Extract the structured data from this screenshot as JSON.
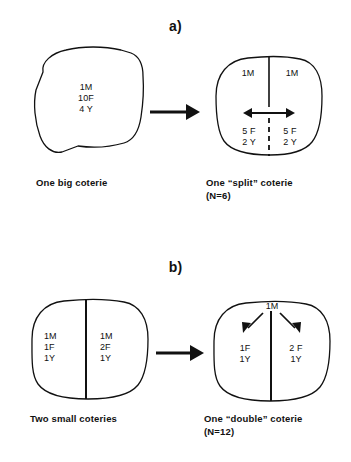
{
  "figure": {
    "background_color": "#ffffff",
    "ink_color": "#111111"
  },
  "panels": [
    {
      "label": "a)",
      "before": {
        "shape": "blob",
        "caption": "One big coterie",
        "compartments": [
          {
            "lines": [
              "1M",
              "10F",
              "4 Y"
            ]
          }
        ]
      },
      "transition_arrow": "right-arrow",
      "after": {
        "shape": "rounded-blob",
        "caption_line1": "One “split” coterie",
        "caption_line2": "(N=6)",
        "divider_top": "solid",
        "divider_bottom": "dashed",
        "inner_arrow": "double-headed-horizontal-arrow",
        "compartments": [
          {
            "position": "top-left",
            "lines": [
              "1M"
            ]
          },
          {
            "position": "top-right",
            "lines": [
              "1M"
            ]
          },
          {
            "position": "bottom-left",
            "lines": [
              "5 F",
              "2 Y"
            ]
          },
          {
            "position": "bottom-right",
            "lines": [
              "5 F",
              "2 Y"
            ]
          }
        ]
      }
    },
    {
      "label": "b)",
      "before": {
        "shape": "rounded-blob",
        "caption": "Two small coteries",
        "divider": "solid",
        "compartments": [
          {
            "position": "left",
            "lines": [
              "1M",
              "1F",
              "1Y"
            ]
          },
          {
            "position": "right",
            "lines": [
              "1M",
              "2F",
              "1Y"
            ]
          }
        ]
      },
      "transition_arrow": "right-arrow",
      "after": {
        "shape": "rounded-blob",
        "caption_line1": "One “double” coterie",
        "caption_line2": "(N=12)",
        "divider": "solid",
        "shared_male_label": "1M",
        "inner_arrows": "two-diagonal-arrows",
        "compartments": [
          {
            "position": "left",
            "lines": [
              "1F",
              "1Y"
            ]
          },
          {
            "position": "right",
            "lines": [
              "2 F",
              "1Y"
            ]
          }
        ]
      }
    }
  ]
}
